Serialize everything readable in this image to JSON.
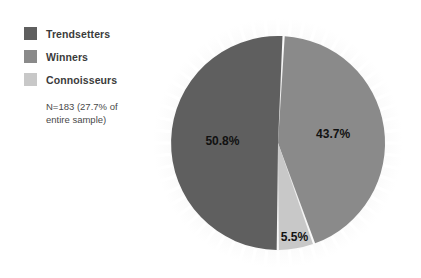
{
  "chart_data": {
    "type": "pie",
    "title": "",
    "categories": [
      "Trendsetters",
      "Winners",
      "Connoisseurs"
    ],
    "values": [
      50.8,
      43.7,
      5.5
    ],
    "value_labels": [
      "50.8%",
      "43.7%",
      "5.5%"
    ],
    "colors": [
      "#5f5f5f",
      "#8a8a8a",
      "#c8c8c8"
    ],
    "annotation": "N=183 (27.7% of entire sample)",
    "annotation_lines": [
      "N=183 (27.7% of",
      "entire sample)"
    ],
    "legend_position": "top-left",
    "grid": false,
    "start_angle_deg": 3,
    "slice_gap_deg": 1.2,
    "background": "#ffffff",
    "halo_color": "#dcdcdc"
  },
  "legend": {
    "items": [
      {
        "label": "Trendsetters",
        "color": "#5f5f5f",
        "value_label": "50.8%"
      },
      {
        "label": "Winners",
        "color": "#8a8a8a",
        "value_label": "43.7%"
      },
      {
        "label": "Connoisseurs",
        "color": "#c8c8c8",
        "value_label": "5.5%"
      }
    ],
    "note_line_1": "N=183 (27.7% of",
    "note_line_2": "entire sample)"
  },
  "pie": {
    "label_trendsetters": "50.8%",
    "label_winners": "43.7%",
    "label_connoisseurs": "5.5%"
  }
}
